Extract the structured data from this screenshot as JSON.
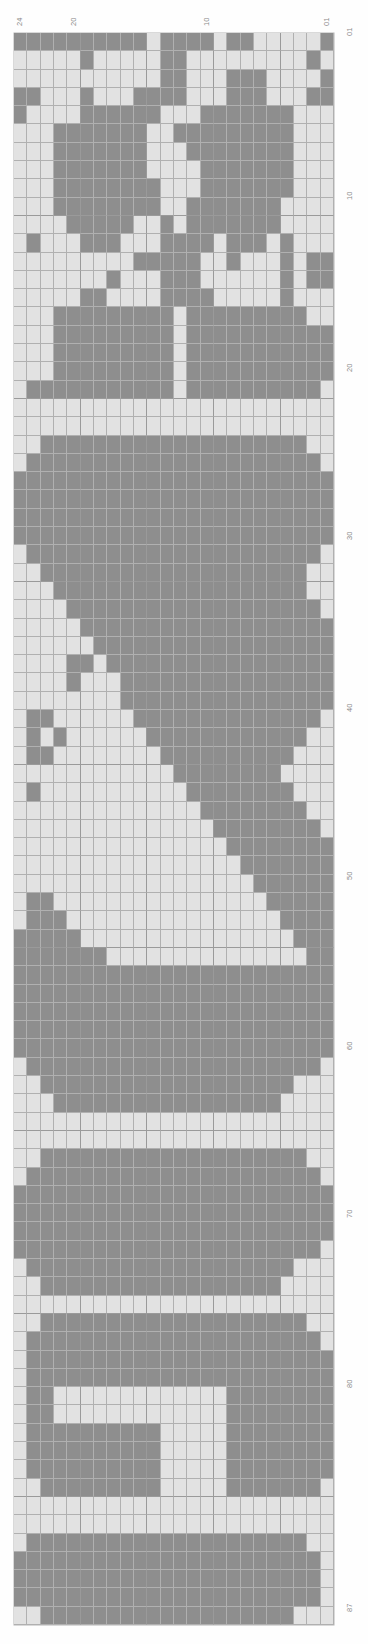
{
  "chart_data": {
    "type": "heatmap",
    "title": "",
    "xlabel": "",
    "ylabel": "",
    "orientation": "rotated-90",
    "grid": true,
    "columns": 24,
    "rows": 87,
    "column_axis_labels": [
      "24",
      "20",
      "10",
      "01"
    ],
    "row_axis_labels": [
      "01",
      "10",
      "20",
      "30",
      "40",
      "50",
      "60",
      "70",
      "80",
      "87"
    ],
    "colors": {
      "light": "#e2e2e2",
      "dark": "#8e8e8e",
      "gridline": "#b0b0b0",
      "major_gridline": "#9a9a9a",
      "label": "#8a8a8a",
      "background": "#ffffff"
    },
    "legend": [],
    "value_map": {
      "0": "light",
      "1": "dark"
    },
    "matrix": [
      "111111111101111011000001",
      "000001000001100000000010",
      "000000000001100011100001",
      "110001000111100011100011",
      "100001111110001111111000",
      "000111111100111111111000",
      "000111111100011111111000",
      "000111111100001111111000",
      "000111111110001111111000",
      "000111111110011111110000",
      "000011111001011111110000",
      "010001110001111011101000",
      "000000000111110010001011",
      "000000010001110000001011",
      "000001100001111000001000",
      "000111111111011111111100",
      "000111111111011111111111",
      "000111111111011111111111",
      "000111111111011111111111",
      "011111111111011111111110",
      "000000000000000000000000",
      "000000000000000000000000",
      "001111111111111111111100",
      "011111111111111111111110",
      "111111111111111111111111",
      "111111111111111111111111",
      "111111111111111111111111",
      "111111111111111111111111",
      "011111111111111111111110",
      "001111111111111111111100",
      "000111111111111111111100",
      "000011111111111111111110",
      "000001111111111111111111",
      "000000111111111111111111",
      "000011011111111111111111",
      "000010001111111111111111",
      "000000001111111111111111",
      "011000000111111111111110",
      "010100000011111111111100",
      "011000000001111111111000",
      "000000000000111111110000",
      "010000000000011111111000",
      "000000000000001111111100",
      "000000000000000111111110",
      "000000000000000011111111",
      "000000000000000001111111",
      "000000000000000000111111",
      "011000000000000000011111",
      "011100000000000000001111",
      "111110000000000000000111",
      "111111100000000000000011",
      "111111111111111111111111",
      "111111111111111111111111",
      "111111111111111111111111",
      "111111111111111111111111",
      "111111111111111111111111",
      "011111111111111111111110",
      "001111111111111111111000",
      "000111111111111111110000",
      "000000000000000000000000",
      "000000000000000000000000",
      "001111111111111111111100",
      "011111111111111111111110",
      "111111111111111111111111",
      "111111111111111111111111",
      "111111111111111111111111",
      "111111111111111111111110",
      "011111111111111111111000",
      "001111111111111111110000",
      "000000000000000000000000",
      "001111111111111111111100",
      "011111111111111111111110",
      "011111111111111111111111",
      "011111111111111111111111",
      "011000000000000011111111",
      "011000000000000011111111",
      "011111111110000011111111",
      "011111111110000011111111",
      "011111111110000011111111",
      "001111111110000011111110",
      "000000000000000000000000",
      "000000000000000000000000",
      "011111111111111111111100",
      "111111111111111111111110",
      "111111111111111111111110",
      "111111111111111111111110",
      "001111111111111111111000",
      "000000000000000000000000"
    ]
  },
  "axis": {
    "top": [
      {
        "label": "24",
        "x": 16,
        "y": 26
      },
      {
        "label": "20",
        "x": 70,
        "y": 26
      },
      {
        "label": "10",
        "x": 203,
        "y": 26
      },
      {
        "label": "01",
        "x": 323,
        "y": 26
      }
    ],
    "right": [
      {
        "label": "01",
        "y": 36
      },
      {
        "label": "10",
        "y": 200
      },
      {
        "label": "20",
        "y": 372
      },
      {
        "label": "30",
        "y": 540
      },
      {
        "label": "40",
        "y": 712
      },
      {
        "label": "50",
        "y": 880
      },
      {
        "label": "60",
        "y": 1050
      },
      {
        "label": "70",
        "y": 1218
      },
      {
        "label": "80",
        "y": 1388
      },
      {
        "label": "87",
        "y": 1612
      }
    ]
  }
}
